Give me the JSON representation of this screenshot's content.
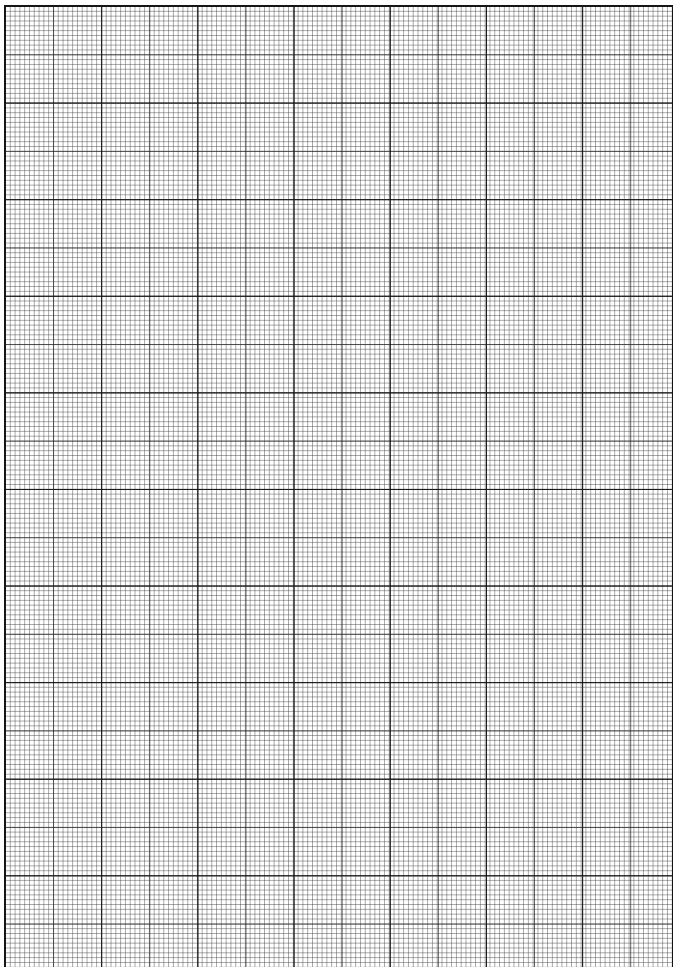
{
  "page": {
    "type": "graph-paper",
    "background_color": "#ffffff",
    "line_color": "#141414",
    "grid": {
      "minor_spacing_px": 4.8,
      "medium_every_minor": 10,
      "major_every_minor": 20,
      "columns_minor": 139,
      "rows_minor": 199
    }
  }
}
